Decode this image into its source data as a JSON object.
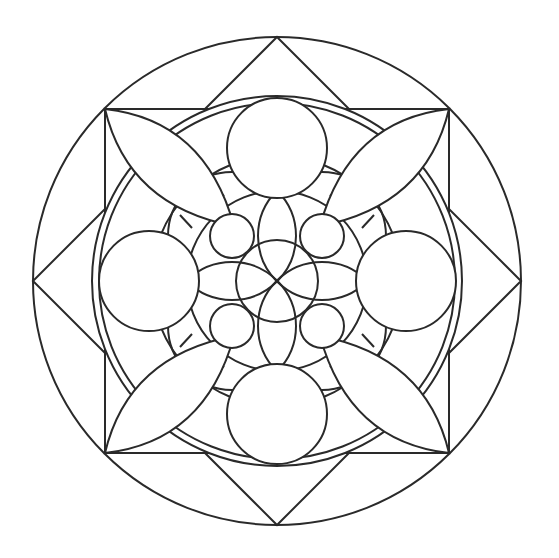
{
  "artwork": {
    "type": "mandala coloring page",
    "background": "#ffffff",
    "line_color": "#2a2a2a",
    "center": [
      277,
      281
    ],
    "outer_circle_radius": 244,
    "square_half_size": 172,
    "diamond_half_diagonal": 244,
    "double_ring_radii": [
      185,
      178
    ],
    "mid_ring_radius": 125,
    "big_circles": {
      "count": 4,
      "radius": 50,
      "distance": 128
    },
    "small_circles": {
      "count": 4,
      "radius": 22,
      "offset": 45
    },
    "center_circle_radius": 41,
    "petals": {
      "count": 4,
      "shape": "lens",
      "from": "square corner",
      "to": "small circle"
    }
  }
}
